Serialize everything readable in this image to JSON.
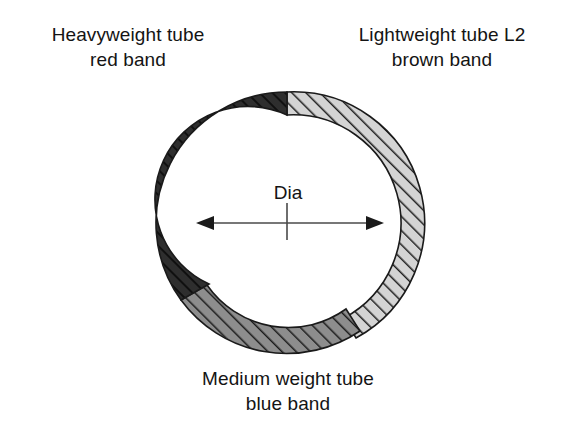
{
  "figure": {
    "type": "cross-section-diagram",
    "background_color": "#ffffff"
  },
  "labels": {
    "heavyweight": {
      "line1": "Heavyweight tube",
      "line2": "red band"
    },
    "lightweight": {
      "line1": "Lightweight tube L2",
      "line2": "brown band"
    },
    "medium": {
      "line1": "Medium weight tube",
      "line2": "blue band"
    }
  },
  "dimension": {
    "label": "Dia",
    "arrow_style": "double-headed",
    "has_centerline_tick": true
  },
  "ring": {
    "center_x": 287,
    "center_y": 223,
    "outer_radius": 131,
    "segments": [
      {
        "name": "heavyweight",
        "band_color_name": "red band",
        "fill": "#2e2e2e",
        "hatch_color": "#141414",
        "inner_radius": 91,
        "start_angle_deg": 270,
        "end_angle_deg": 396,
        "wall_thickness": 40,
        "relative_weight": "heaviest"
      },
      {
        "name": "medium",
        "band_color_name": "blue band",
        "fill": "#8a8a8a",
        "hatch_color": "#1d1d1d",
        "inner_radius": 99,
        "start_angle_deg": 36,
        "end_angle_deg": 124,
        "wall_thickness": 32,
        "relative_weight": "medium"
      },
      {
        "name": "lightweight",
        "band_color_name": "brown band",
        "fill": "#d2d2d2",
        "hatch_color": "#1d1d1d",
        "inner_radius": 108,
        "start_angle_deg": 122,
        "end_angle_deg": 270,
        "wall_thickness": 23,
        "relative_weight": "lightest"
      }
    ]
  },
  "colors": {
    "stroke": "#1a1a1a",
    "text": "#141414",
    "bore": "#ffffff"
  }
}
